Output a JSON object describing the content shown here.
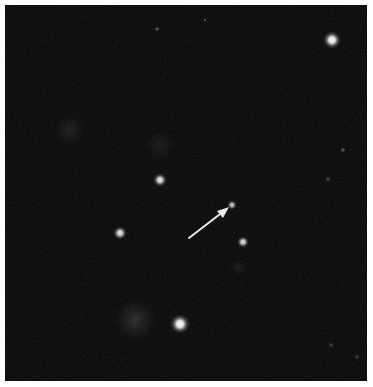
{
  "image": {
    "subject": "astronomical field with point sources and faint nebulae",
    "background_color": "#050505",
    "border_color": "#ffffff"
  },
  "annotation": {
    "type": "arrow",
    "color": "#e8e8e8",
    "points_to": "faint point source near image center"
  },
  "sources": [
    {
      "kind": "star",
      "brightness": 1.0
    },
    {
      "kind": "star",
      "brightness": 1.0
    },
    {
      "kind": "star",
      "brightness": 0.9
    },
    {
      "kind": "star",
      "brightness": 0.9
    },
    {
      "kind": "star",
      "brightness": 0.85
    },
    {
      "kind": "star",
      "brightness": 0.75
    },
    {
      "kind": "star",
      "brightness": 0.3
    },
    {
      "kind": "star",
      "brightness": 0.25
    },
    {
      "kind": "star",
      "brightness": 0.3
    },
    {
      "kind": "star",
      "brightness": 0.25
    },
    {
      "kind": "star",
      "brightness": 0.2
    },
    {
      "kind": "star",
      "brightness": 0.2
    },
    {
      "kind": "nebula",
      "brightness": 0.35
    },
    {
      "kind": "nebula",
      "brightness": 0.22
    },
    {
      "kind": "nebula",
      "brightness": 0.18
    },
    {
      "kind": "nebula",
      "brightness": 0.15
    }
  ]
}
